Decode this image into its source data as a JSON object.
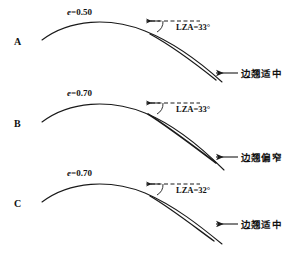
{
  "figure": {
    "type": "diagram",
    "panels": [
      {
        "letter": "A",
        "e_label": "e=0.50",
        "e_symbol": "e",
        "e_value": "=0.50",
        "lza_label": "LZA=33°",
        "lza_value": 33,
        "annotation": "边翘适中",
        "arrow_icon": "left-arrow-icon",
        "dashed_icon": "dashed-reference-line"
      },
      {
        "letter": "B",
        "e_label": "e=0.70",
        "e_symbol": "e",
        "e_value": "=0.70",
        "lza_label": "LZA=33°",
        "lza_value": 33,
        "annotation": "边翘偏窄",
        "arrow_icon": "left-arrow-icon",
        "dashed_icon": "dashed-reference-line"
      },
      {
        "letter": "C",
        "e_label": "e=0.70",
        "e_symbol": "e",
        "e_value": "=0.70",
        "lza_label": "LZA=32°",
        "lza_value": 32,
        "annotation": "边翘适中",
        "arrow_icon": "left-arrow-icon",
        "dashed_icon": "dashed-reference-line"
      }
    ],
    "colors": {
      "line": "#1a1a1a",
      "background": "#ffffff",
      "text": "#111111"
    }
  }
}
